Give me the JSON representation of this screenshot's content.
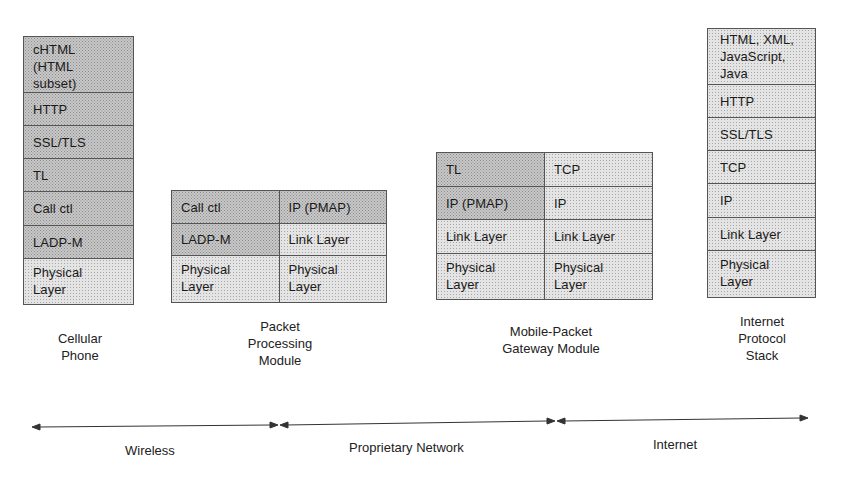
{
  "diagram": {
    "stacks": [
      {
        "id": "cellular-phone",
        "caption": "Cellular\nPhone",
        "columns": 1,
        "rows": [
          {
            "cells": [
              "cHTML\n(HTML\nsubset)"
            ],
            "shade": [
              "dark"
            ]
          },
          {
            "cells": [
              "HTTP"
            ],
            "shade": [
              "dark"
            ]
          },
          {
            "cells": [
              "SSL/TLS"
            ],
            "shade": [
              "dark"
            ]
          },
          {
            "cells": [
              "TL"
            ],
            "shade": [
              "dark"
            ]
          },
          {
            "cells": [
              "Call ctl"
            ],
            "shade": [
              "dark"
            ]
          },
          {
            "cells": [
              "LADP-M"
            ],
            "shade": [
              "dark"
            ]
          },
          {
            "cells": [
              "Physical\nLayer"
            ],
            "shade": [
              "light"
            ]
          }
        ]
      },
      {
        "id": "packet-processing-module",
        "caption": "Packet\nProcessing\nModule",
        "columns": 2,
        "rows": [
          {
            "cells": [
              "Call ctl",
              "IP (PMAP)"
            ],
            "shade": [
              "dark",
              "dark"
            ]
          },
          {
            "cells": [
              "LADP-M",
              "Link Layer"
            ],
            "shade": [
              "dark",
              "light"
            ]
          },
          {
            "cells": [
              "Physical\nLayer",
              "Physical\nLayer"
            ],
            "shade": [
              "light",
              "light"
            ]
          }
        ]
      },
      {
        "id": "mobile-packet-gateway-module",
        "caption": "Mobile-Packet\nGateway Module",
        "columns": 2,
        "rows": [
          {
            "cells": [
              "TL",
              "TCP"
            ],
            "shade": [
              "dark",
              "light"
            ]
          },
          {
            "cells": [
              "IP (PMAP)",
              "IP"
            ],
            "shade": [
              "dark",
              "light"
            ]
          },
          {
            "cells": [
              "Link Layer",
              "Link Layer"
            ],
            "shade": [
              "light",
              "light"
            ]
          },
          {
            "cells": [
              "Physical\nLayer",
              "Physical\nLayer"
            ],
            "shade": [
              "light",
              "light"
            ]
          }
        ]
      },
      {
        "id": "internet-protocol-stack",
        "caption": "Internet\nProtocol\nStack",
        "columns": 1,
        "rows": [
          {
            "cells": [
              "HTML, XML,\nJavaScript,\nJava"
            ],
            "shade": [
              "light"
            ]
          },
          {
            "cells": [
              "HTTP"
            ],
            "shade": [
              "light"
            ]
          },
          {
            "cells": [
              "SSL/TLS"
            ],
            "shade": [
              "light"
            ]
          },
          {
            "cells": [
              "TCP"
            ],
            "shade": [
              "light"
            ]
          },
          {
            "cells": [
              "IP"
            ],
            "shade": [
              "light"
            ]
          },
          {
            "cells": [
              "Link Layer"
            ],
            "shade": [
              "light"
            ]
          },
          {
            "cells": [
              "Physical\nLayer"
            ],
            "shade": [
              "light"
            ]
          }
        ]
      }
    ],
    "regions": [
      {
        "label": "Wireless"
      },
      {
        "label": "Proprietary Network"
      },
      {
        "label": "Internet"
      }
    ],
    "colors": {
      "border": "#555555",
      "shade_dark": "#c9c9c9",
      "shade_light": "#e4e4e4",
      "text": "#1a1a1a"
    }
  }
}
